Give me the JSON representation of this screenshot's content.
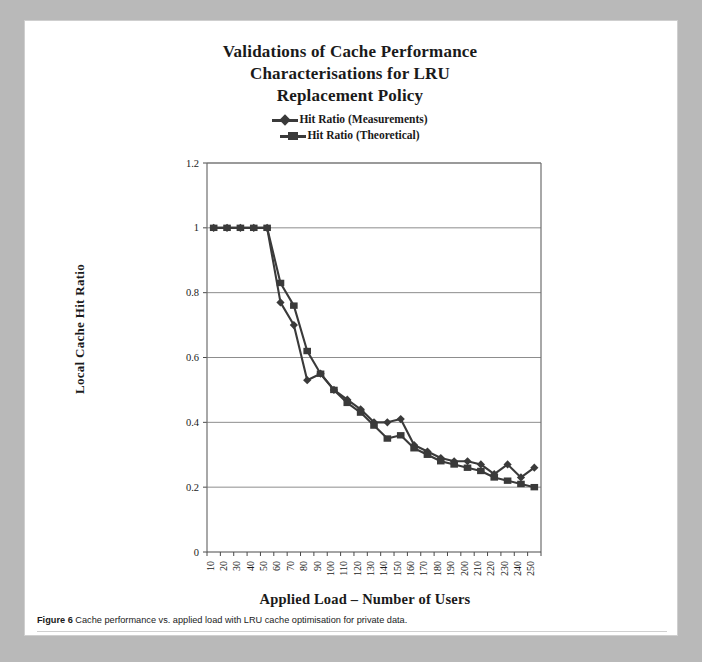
{
  "figure": {
    "title_lines": [
      "Validations of Cache Performance",
      "Characterisations for LRU",
      "Replacement Policy"
    ],
    "caption_label": "Figure 6",
    "caption_text": "Cache performance vs. applied load with LRU cache optimisation for private data."
  },
  "chart_data": {
    "type": "line",
    "title": "Validations of Cache Performance Characterisations for LRU Replacement Policy",
    "xlabel": "Applied Load – Number of Users",
    "ylabel": "Local Cache Hit Ratio",
    "categories": [
      10,
      20,
      30,
      40,
      50,
      60,
      70,
      80,
      90,
      100,
      110,
      120,
      130,
      140,
      150,
      160,
      170,
      180,
      190,
      200,
      210,
      220,
      230,
      240,
      250
    ],
    "series": [
      {
        "name": "Hit Ratio (Measurements)",
        "marker": "diamond",
        "color": "#3a3a3a",
        "values": [
          1.0,
          1.0,
          1.0,
          1.0,
          1.0,
          0.77,
          0.7,
          0.53,
          0.55,
          0.5,
          0.47,
          0.44,
          0.4,
          0.4,
          0.41,
          0.33,
          0.31,
          0.29,
          0.28,
          0.28,
          0.27,
          0.24,
          0.27,
          0.23,
          0.26
        ]
      },
      {
        "name": "Hit Ratio (Theoretical)",
        "marker": "square",
        "color": "#3a3a3a",
        "values": [
          1.0,
          1.0,
          1.0,
          1.0,
          1.0,
          0.83,
          0.76,
          0.62,
          0.55,
          0.5,
          0.46,
          0.43,
          0.39,
          0.35,
          0.36,
          0.32,
          0.3,
          0.28,
          0.27,
          0.26,
          0.25,
          0.23,
          0.22,
          0.21,
          0.2
        ]
      }
    ],
    "ylim": [
      0,
      1.2
    ],
    "yticks": [
      0,
      0.2,
      0.4,
      0.6,
      0.8,
      1,
      1.2
    ],
    "ytick_labels": [
      "0",
      "0.2",
      "0.4",
      "0.6",
      "0.8",
      "1",
      "1.2"
    ],
    "grid": "horizontal",
    "legend_position": "top-center"
  }
}
